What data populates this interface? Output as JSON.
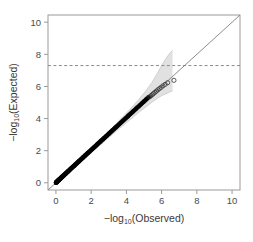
{
  "chart_data": {
    "type": "scatter",
    "title": "",
    "subtitle": "",
    "xlabel": "−log",
    "xlabel_sub": "10",
    "xlabel_tail": "(Observed)",
    "ylabel": "−log",
    "ylabel_sub": "10",
    "ylabel_tail": "(Expected)",
    "xlim": [
      -0.45,
      10.45
    ],
    "ylim": [
      -0.45,
      10.45
    ],
    "xticks": [
      0,
      2,
      4,
      6,
      8,
      10
    ],
    "yticks": [
      0,
      2,
      4,
      6,
      8,
      10
    ],
    "xtick_labels": [
      "0",
      "2",
      "4",
      "6",
      "8",
      "10"
    ],
    "ytick_labels": [
      "0",
      "2",
      "4",
      "6",
      "8",
      "10"
    ],
    "grid": false,
    "legend": "none",
    "colors": {
      "points_bulk": "#000000",
      "points_tail": "#333333",
      "reference_line": "#808080",
      "threshold_line": "#8a8a8a",
      "confidence_band": "#c8c8c8",
      "axis": "#9a9a9a",
      "text": "#3a3a3a",
      "background": "#ffffff"
    },
    "annotations": [
      {
        "name": "genome-wide-significance-threshold",
        "type": "hline",
        "y": 7.3,
        "style": "dashed",
        "label": ""
      },
      {
        "name": "identity-reference-line",
        "type": "line",
        "x0": -0.45,
        "y0": -0.45,
        "x1": 10.45,
        "y1": 10.45,
        "style": "solid",
        "label": ""
      }
    ],
    "series": [
      {
        "name": "bulk-points",
        "marker": "filled-circle",
        "x": [
          0.004,
          0.012,
          0.021,
          0.03,
          0.04,
          0.051,
          0.062,
          0.074,
          0.086,
          0.099,
          0.112,
          0.126,
          0.14,
          0.155,
          0.17,
          0.186,
          0.202,
          0.219,
          0.236,
          0.254,
          0.272,
          0.291,
          0.31,
          0.33,
          0.35,
          0.371,
          0.392,
          0.414,
          0.436,
          0.459,
          0.482,
          0.506,
          0.53,
          0.555,
          0.58,
          0.606,
          0.632,
          0.659,
          0.686,
          0.714,
          0.742,
          0.771,
          0.8,
          0.83,
          0.86,
          0.891,
          0.922,
          0.954,
          0.986,
          1.019,
          1.052,
          1.086,
          1.12,
          1.155,
          1.19,
          1.226,
          1.262,
          1.299,
          1.336,
          1.374,
          1.412,
          1.451,
          1.49,
          1.53,
          1.57,
          1.611,
          1.652,
          1.694,
          1.736,
          1.779,
          1.822,
          1.866,
          1.91,
          1.955,
          2.0,
          2.046,
          2.092,
          2.139,
          2.186,
          2.234,
          2.282,
          2.331,
          2.38,
          2.43,
          2.48,
          2.531,
          2.582,
          2.634,
          2.686,
          2.739,
          2.792,
          2.846,
          2.9,
          2.955,
          3.01,
          3.066,
          3.122,
          3.179,
          3.236,
          3.294,
          3.352,
          3.411,
          3.47,
          3.53,
          3.59,
          3.651,
          3.712,
          3.774,
          3.836,
          3.899,
          3.962,
          4.026,
          4.09,
          4.155,
          4.22,
          4.286,
          4.352,
          4.419,
          4.486,
          4.554,
          4.622,
          4.691,
          4.76,
          4.83,
          4.9,
          4.971,
          5.042,
          5.114,
          5.186,
          5.259
        ],
        "y": [
          0.005,
          0.014,
          0.024,
          0.034,
          0.045,
          0.056,
          0.068,
          0.08,
          0.093,
          0.106,
          0.12,
          0.134,
          0.149,
          0.164,
          0.18,
          0.196,
          0.213,
          0.23,
          0.248,
          0.266,
          0.285,
          0.304,
          0.324,
          0.344,
          0.365,
          0.386,
          0.408,
          0.43,
          0.453,
          0.476,
          0.5,
          0.524,
          0.549,
          0.574,
          0.6,
          0.626,
          0.653,
          0.68,
          0.708,
          0.736,
          0.765,
          0.794,
          0.824,
          0.854,
          0.885,
          0.916,
          0.948,
          0.98,
          1.013,
          1.046,
          1.08,
          1.114,
          1.149,
          1.184,
          1.22,
          1.256,
          1.293,
          1.33,
          1.368,
          1.406,
          1.445,
          1.484,
          1.524,
          1.564,
          1.605,
          1.646,
          1.688,
          1.73,
          1.773,
          1.816,
          1.86,
          1.904,
          1.949,
          1.994,
          2.04,
          2.086,
          2.133,
          2.18,
          2.228,
          2.276,
          2.325,
          2.374,
          2.424,
          2.474,
          2.525,
          2.576,
          2.628,
          2.68,
          2.733,
          2.786,
          2.84,
          2.894,
          2.949,
          3.004,
          3.06,
          3.116,
          3.173,
          3.23,
          3.288,
          3.346,
          3.405,
          3.464,
          3.524,
          3.584,
          3.645,
          3.706,
          3.768,
          3.83,
          3.893,
          3.956,
          4.02,
          4.084,
          4.149,
          4.214,
          4.28,
          4.346,
          4.413,
          4.48,
          4.548,
          4.616,
          4.685,
          4.754,
          4.824,
          4.894,
          4.965,
          5.036,
          5.108,
          5.18,
          5.253,
          5.326
        ]
      },
      {
        "name": "tail-points",
        "marker": "open-circle",
        "x": [
          5.33,
          5.4,
          5.47,
          5.54,
          5.62,
          5.7,
          5.79,
          5.88,
          5.98,
          6.08,
          6.2,
          6.34,
          6.7
        ],
        "y": [
          5.36,
          5.43,
          5.49,
          5.56,
          5.63,
          5.71,
          5.79,
          5.87,
          5.95,
          6.04,
          6.13,
          6.23,
          6.38
        ]
      }
    ],
    "confidence_band": {
      "name": "pointwise-confidence-band",
      "x": [
        0.0,
        0.6,
        1.2,
        1.8,
        2.4,
        3.0,
        3.6,
        4.2,
        4.7,
        5.1,
        5.45,
        5.75,
        6.0,
        6.25,
        6.45,
        6.62
      ],
      "upper": [
        0.1,
        0.7,
        1.32,
        1.95,
        2.58,
        3.22,
        3.88,
        4.58,
        5.18,
        5.72,
        6.25,
        6.8,
        7.3,
        7.75,
        8.05,
        8.25
      ],
      "lower": [
        0.0,
        0.52,
        1.1,
        1.68,
        2.25,
        2.82,
        3.38,
        3.92,
        4.38,
        4.72,
        5.02,
        5.25,
        5.42,
        5.55,
        5.65,
        5.72
      ]
    }
  }
}
